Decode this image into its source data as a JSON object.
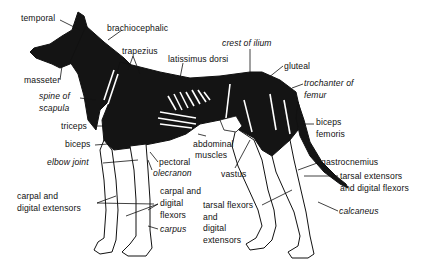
{
  "diagram": {
    "colors": {
      "ink": "#111111",
      "background": "#ffffff",
      "muscle_dark": "#141414"
    },
    "labels": [
      {
        "id": "temporal",
        "text": "temporal",
        "style": "normal",
        "x": 21,
        "y": 13
      },
      {
        "id": "brachiocephalic",
        "text": "brachiocephalic",
        "style": "normal",
        "x": 107,
        "y": 23
      },
      {
        "id": "trapezius",
        "text": "trapezius",
        "style": "normal",
        "x": 122,
        "y": 46
      },
      {
        "id": "latissimus-dorsi",
        "text": "latissimus dorsi",
        "style": "normal",
        "x": 168,
        "y": 54
      },
      {
        "id": "crest-of-ilium",
        "text": "crest of ilium",
        "style": "italic",
        "x": 222,
        "y": 38
      },
      {
        "id": "gluteal",
        "text": "gluteal",
        "style": "normal",
        "x": 284,
        "y": 61
      },
      {
        "id": "trochanter-of-femur-1",
        "text": "trochanter of",
        "style": "italic",
        "x": 304,
        "y": 78
      },
      {
        "id": "trochanter-of-femur-2",
        "text": "femur",
        "style": "italic",
        "x": 304,
        "y": 90
      },
      {
        "id": "masseter",
        "text": "masseter",
        "style": "normal",
        "x": 24,
        "y": 75
      },
      {
        "id": "spine-of-scapula-1",
        "text": "spine of",
        "style": "italic",
        "x": 39,
        "y": 91
      },
      {
        "id": "spine-of-scapula-2",
        "text": "scapula",
        "style": "italic",
        "x": 39,
        "y": 103
      },
      {
        "id": "triceps",
        "text": "triceps",
        "style": "normal",
        "x": 61,
        "y": 121
      },
      {
        "id": "biceps",
        "text": "biceps",
        "style": "normal",
        "x": 65,
        "y": 139
      },
      {
        "id": "elbow-joint",
        "text": "elbow joint",
        "style": "italic",
        "x": 47,
        "y": 157
      },
      {
        "id": "pectoral",
        "text": "pectoral",
        "style": "normal",
        "x": 159,
        "y": 157
      },
      {
        "id": "olecranon",
        "text": "olecranon",
        "style": "italic",
        "x": 153,
        "y": 168
      },
      {
        "id": "abdominal-muscles-1",
        "text": "abdominal",
        "style": "normal",
        "x": 193,
        "y": 139
      },
      {
        "id": "abdominal-muscles-2",
        "text": "muscles",
        "style": "normal",
        "x": 195,
        "y": 150
      },
      {
        "id": "vastus",
        "text": "vastus",
        "style": "normal",
        "x": 221,
        "y": 169
      },
      {
        "id": "biceps-femoris-1",
        "text": "biceps",
        "style": "normal",
        "x": 316,
        "y": 117
      },
      {
        "id": "biceps-femoris-2",
        "text": "femoris",
        "style": "normal",
        "x": 316,
        "y": 129
      },
      {
        "id": "gastrocnemius",
        "text": "gastrocnemius",
        "style": "normal",
        "x": 321,
        "y": 157
      },
      {
        "id": "tarsal-ext-digital-flex-1",
        "text": "tarsal extensors",
        "style": "normal",
        "x": 340,
        "y": 171
      },
      {
        "id": "tarsal-ext-digital-flex-2",
        "text": "and digital flexors",
        "style": "normal",
        "x": 340,
        "y": 183
      },
      {
        "id": "carpal-digital-ext-1",
        "text": "carpal and",
        "style": "normal",
        "x": 17,
        "y": 191
      },
      {
        "id": "carpal-digital-ext-2",
        "text": "digital extensors",
        "style": "normal",
        "x": 17,
        "y": 203
      },
      {
        "id": "carpal-digital-flex-1",
        "text": "carpal and",
        "style": "normal",
        "x": 160,
        "y": 186
      },
      {
        "id": "carpal-digital-flex-2",
        "text": "digital",
        "style": "normal",
        "x": 160,
        "y": 198
      },
      {
        "id": "carpal-digital-flex-3",
        "text": "flexors",
        "style": "normal",
        "x": 160,
        "y": 210
      },
      {
        "id": "carpus",
        "text": "carpus",
        "style": "italic",
        "x": 160,
        "y": 224
      },
      {
        "id": "tarsal-flex-digital-ext-1",
        "text": "tarsal flexors",
        "style": "normal",
        "x": 203,
        "y": 200
      },
      {
        "id": "tarsal-flex-digital-ext-2",
        "text": "and",
        "style": "normal",
        "x": 203,
        "y": 212
      },
      {
        "id": "tarsal-flex-digital-ext-3",
        "text": "digital",
        "style": "normal",
        "x": 203,
        "y": 223
      },
      {
        "id": "tarsal-flex-digital-ext-4",
        "text": "extensors",
        "style": "normal",
        "x": 203,
        "y": 235
      },
      {
        "id": "calcaneus",
        "text": "calcaneus",
        "style": "italic",
        "x": 339,
        "y": 206
      }
    ]
  }
}
